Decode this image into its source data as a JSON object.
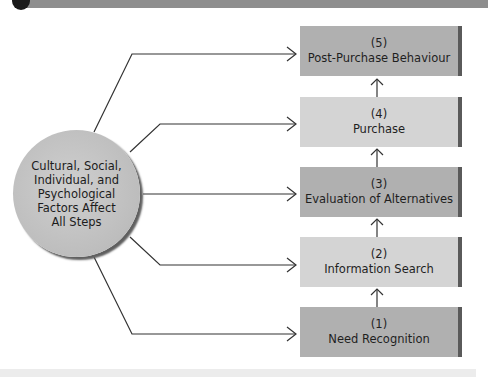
{
  "diagram": {
    "center_node": {
      "label": "Cultural, Social, Individual, and Psychological Factors Affect All Steps",
      "lines": [
        "Cultural, Social,",
        "Individual, and",
        "Psychological",
        "Factors Affect",
        "All Steps"
      ]
    },
    "steps": [
      {
        "number": "(5)",
        "label": "Post-Purchase Behaviour",
        "shade": "dark"
      },
      {
        "number": "(4)",
        "label": "Purchase",
        "shade": "light"
      },
      {
        "number": "(3)",
        "label": "Evaluation of Alternatives",
        "shade": "dark"
      },
      {
        "number": "(2)",
        "label": "Information Search",
        "shade": "light"
      },
      {
        "number": "(1)",
        "label": "Need Recognition",
        "shade": "dark"
      }
    ],
    "flow": "Need Recognition → Information Search → Evaluation of Alternatives → Purchase → Post-Purchase Behaviour",
    "colors": {
      "dark_box": "#b0b0b0",
      "light_box": "#d4d4d4",
      "box_edge": "#5a5a5a",
      "circle": "#bdbdbd",
      "line": "#333333"
    }
  }
}
